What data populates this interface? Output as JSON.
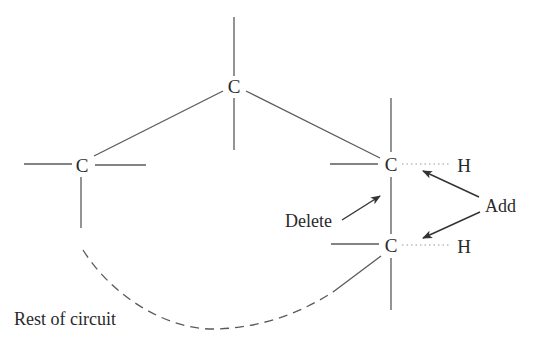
{
  "diagram": {
    "atoms": {
      "top_carbon": "C",
      "left_carbon": "C",
      "right_upper_carbon": "C",
      "right_lower_carbon": "C",
      "upper_hydrogen": "H",
      "lower_hydrogen": "H"
    },
    "labels": {
      "delete": "Delete",
      "add": "Add",
      "rest_of_circuit": "Rest of circuit"
    },
    "colors": {
      "bond": "#5a5a5a",
      "arrow": "#333333",
      "text": "#2a2a2a",
      "background": "#ffffff"
    }
  }
}
